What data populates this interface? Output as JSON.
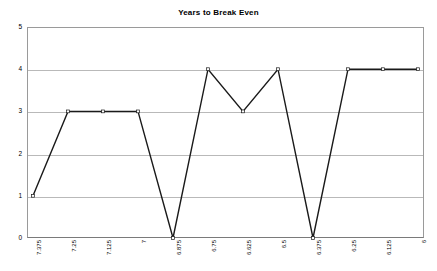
{
  "chart_data": {
    "type": "line",
    "title": "Years to Break Even",
    "xlabel": "",
    "ylabel": "",
    "categories": [
      "7.375",
      "7.25",
      "7.125",
      "7",
      "6.875",
      "6.75",
      "6.625",
      "6.5",
      "6.375",
      "6.25",
      "6.125",
      "6"
    ],
    "x": [
      "7.375",
      "7.25",
      "7.125",
      "7",
      "6.875",
      "6.75",
      "6.625",
      "6.5",
      "6.375",
      "6.25",
      "6.125",
      "6"
    ],
    "values": [
      1,
      3,
      3,
      3,
      0,
      4,
      3,
      4,
      0,
      4,
      4,
      4
    ],
    "ylim": [
      0,
      5
    ],
    "yticks": [
      "0",
      "1",
      "2",
      "3",
      "4",
      "5"
    ],
    "grid": true,
    "legend": false,
    "marker": "diamond",
    "line_color": "#1a1a1a",
    "grid_color": "#b9b9b9",
    "plot_border_color": "#9a9a9a",
    "background_color": "#ffffff"
  }
}
